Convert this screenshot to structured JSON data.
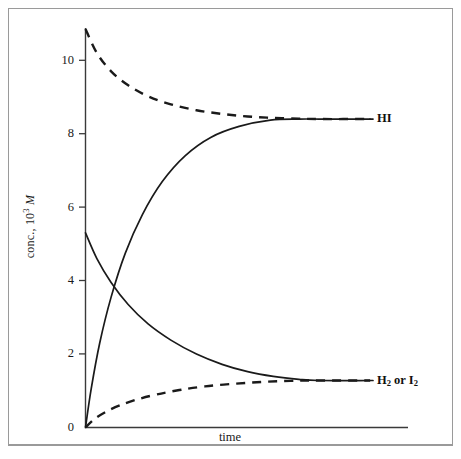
{
  "figure": {
    "axes": {
      "y_tick_labels": [
        "10",
        "8",
        "6",
        "4",
        "2",
        "0"
      ],
      "y_axis_label_prefix": "conc., 10",
      "y_axis_label_exponent": "3",
      "y_axis_label_unit": "M",
      "x_axis_label": "time"
    },
    "series_labels": {
      "hi": "HI",
      "h2_or_i2_prefix": "H",
      "h2_or_i2_sub1": "2",
      "h2_or_i2_mid": " or I",
      "h2_or_i2_sub2": "2"
    }
  },
  "chart_data": {
    "type": "line",
    "title": "",
    "subtitle": "",
    "xlabel": "time",
    "ylabel": "conc., 10^3 M",
    "xlim": [
      0,
      1
    ],
    "ylim": [
      0,
      11
    ],
    "yticks": [
      0,
      2,
      4,
      6,
      8,
      10
    ],
    "ytick_labels": [
      "0",
      "2",
      "4",
      "6",
      "8",
      "10"
    ],
    "xticks": [],
    "xtick_labels": [],
    "grid": false,
    "legend": "inline-right-end-labels",
    "annotations": [
      {
        "text": "HI",
        "at_x": 1.0,
        "at_y": 8.4,
        "placement": "right-of-curve-end"
      },
      {
        "text": "H2 or I2",
        "at_x": 1.0,
        "at_y": 1.28,
        "placement": "right-of-curve-end"
      }
    ],
    "equilibrium_values": {
      "HI": 8.4,
      "H2_or_I2": 1.28
    },
    "series": [
      {
        "name": "HI (formed from H2 + I2)",
        "label": "HI",
        "style": "solid",
        "color": "#1a1a1a",
        "start_y": 0.0,
        "end_y": 8.4,
        "x": [
          0.0,
          0.02,
          0.05,
          0.09,
          0.14,
          0.2,
          0.27,
          0.35,
          0.44,
          0.54,
          0.65,
          0.75,
          0.82,
          0.88,
          1.0
        ],
        "y": [
          0.0,
          1.05,
          2.3,
          3.55,
          4.75,
          5.8,
          6.7,
          7.4,
          7.9,
          8.2,
          8.37,
          8.4,
          8.4,
          8.4,
          8.4
        ]
      },
      {
        "name": "HI (decomposing, starting pure HI)",
        "label": "HI",
        "style": "dashed",
        "color": "#1a1a1a",
        "start_y": 10.85,
        "end_y": 8.4,
        "x": [
          0.0,
          0.04,
          0.09,
          0.15,
          0.22,
          0.3,
          0.39,
          0.48,
          0.57,
          0.66,
          0.75,
          0.82,
          1.0
        ],
        "y": [
          10.85,
          10.2,
          9.7,
          9.32,
          9.02,
          8.8,
          8.64,
          8.54,
          8.47,
          8.43,
          8.41,
          8.4,
          8.4
        ]
      },
      {
        "name": "H2 or I2 (consumed)",
        "label": "H2 or I2",
        "style": "solid",
        "color": "#1a1a1a",
        "start_y": 5.3,
        "end_y": 1.28,
        "x": [
          0.0,
          0.04,
          0.09,
          0.15,
          0.22,
          0.3,
          0.39,
          0.48,
          0.57,
          0.66,
          0.75,
          0.82,
          1.0
        ],
        "y": [
          5.3,
          4.6,
          3.95,
          3.35,
          2.82,
          2.38,
          2.0,
          1.72,
          1.52,
          1.39,
          1.31,
          1.28,
          1.28
        ]
      },
      {
        "name": "H2 or I2 (formed from HI decomposition)",
        "label": "H2 or I2",
        "style": "dashed",
        "color": "#1a1a1a",
        "start_y": 0.0,
        "end_y": 1.28,
        "x": [
          0.0,
          0.03,
          0.07,
          0.12,
          0.18,
          0.25,
          0.33,
          0.42,
          0.52,
          0.62,
          0.72,
          0.82,
          1.0
        ],
        "y": [
          0.0,
          0.22,
          0.42,
          0.6,
          0.76,
          0.9,
          1.02,
          1.12,
          1.19,
          1.24,
          1.27,
          1.28,
          1.28
        ]
      }
    ]
  }
}
